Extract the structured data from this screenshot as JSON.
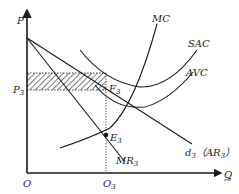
{
  "diagram": {
    "title": "",
    "axes": {
      "y_label": "P",
      "x_label": "Q",
      "origin_label": "O"
    },
    "curves": {
      "mc": "MC",
      "sac": "SAC",
      "avc": "AVC",
      "demand": "d",
      "demand_sub": "3",
      "demand_paren": "（AR",
      "demand_paren_sub": "3",
      "demand_paren_close": "）",
      "mr": "MR",
      "mr_sub": "3"
    },
    "points": {
      "f": "F",
      "f_sub": "3",
      "e": "E",
      "e_sub": "3",
      "p": "P",
      "p_sub": "3",
      "q": "O",
      "q_sub": "3"
    },
    "colors": {
      "line": "#1a1a1a",
      "background": "#ffffff"
    }
  }
}
